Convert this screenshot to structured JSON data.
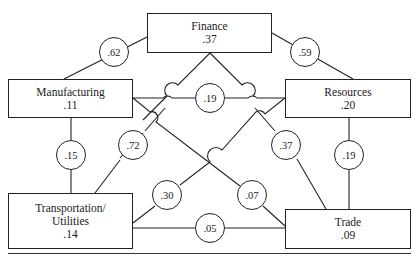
{
  "diagram": {
    "nodes": [
      {
        "id": "finance",
        "label": "Finance",
        "value": ".37"
      },
      {
        "id": "manufacturing",
        "label": "Manufacturing",
        "value": ".11"
      },
      {
        "id": "resources",
        "label": "Resources",
        "value": ".20"
      },
      {
        "id": "transportation",
        "label_line1": "Transportation/",
        "label_line2": "Utilities",
        "value": ".14"
      },
      {
        "id": "trade",
        "label": "Trade",
        "value": ".09"
      }
    ],
    "edges": [
      {
        "from": "manufacturing",
        "to": "finance",
        "coefficient": ".62"
      },
      {
        "from": "finance",
        "to": "resources",
        "coefficient": ".59"
      },
      {
        "from": "manufacturing",
        "to": "resources",
        "coefficient": ".19"
      },
      {
        "from": "manufacturing",
        "to": "transportation",
        "coefficient": ".15"
      },
      {
        "from": "finance",
        "to": "transportation",
        "coefficient": ".72"
      },
      {
        "from": "finance",
        "to": "trade",
        "coefficient": ".37"
      },
      {
        "from": "resources",
        "to": "trade",
        "coefficient": ".19"
      },
      {
        "from": "resources",
        "to": "transportation",
        "coefficient": ".30"
      },
      {
        "from": "manufacturing",
        "to": "trade",
        "coefficient": ".07"
      },
      {
        "from": "transportation",
        "to": "trade",
        "coefficient": ".05"
      }
    ]
  }
}
